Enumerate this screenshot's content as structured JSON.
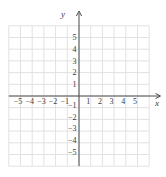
{
  "figure": {
    "kind": "empty-coordinate-plane",
    "background": "#ffffff",
    "grid_color": "#e2e2e2",
    "axis_color": "#4a4a4a",
    "label_color": "#3a3a3a"
  },
  "chart_data": {
    "type": "scatter",
    "series": [],
    "title": "",
    "xlabel": "x",
    "ylabel": "y",
    "xlim": [
      -6,
      6
    ],
    "ylim": [
      -6,
      6
    ],
    "grid": true,
    "x_tick_values": [
      -5,
      -4,
      -3,
      -2,
      -1,
      1,
      2,
      3,
      4,
      5
    ],
    "x_tick_labels": [
      "−5",
      "−4",
      "−3",
      "−2",
      "−1",
      "1",
      "2",
      "3",
      "4",
      "5"
    ],
    "y_tick_values": [
      5,
      4,
      3,
      2,
      1,
      -1,
      -2,
      -3,
      -4,
      -5
    ],
    "y_tick_labels": [
      "5",
      "4",
      "3",
      "2",
      "1",
      "−1",
      "−2",
      "−3",
      "−4",
      "−5"
    ]
  }
}
